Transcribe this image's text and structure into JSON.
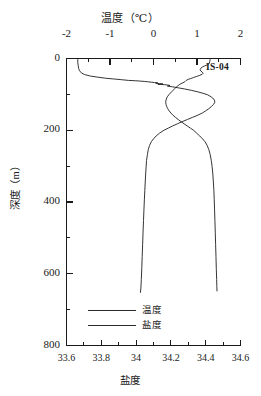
{
  "station": {
    "label": "IS-04"
  },
  "axes": {
    "top": {
      "title": "温度（℃）",
      "ticks": [
        "-2",
        "-1",
        "0",
        "1",
        "2"
      ]
    },
    "bottom": {
      "title": "盐度",
      "ticks": [
        "33.6",
        "33.8",
        "34",
        "34.2",
        "34.4",
        "34.6"
      ]
    },
    "left": {
      "title": "深度（m）",
      "ticks": [
        "0",
        "200",
        "400",
        "600",
        "800"
      ]
    }
  },
  "legend": {
    "items": [
      {
        "name": "温度"
      },
      {
        "name": "盐度"
      }
    ]
  },
  "chart_data": {
    "type": "line",
    "title": "温度（℃）",
    "subtitle": "IS-04",
    "xlabel_top": "温度（℃）",
    "xlabel_bottom": "盐度",
    "ylabel": "深度（m）",
    "grid": false,
    "legend_position": "inside-lower-left",
    "y_axis": {
      "label": "深度（m）",
      "min": 0,
      "max": 800,
      "inverted": true,
      "major_step": 200,
      "minor_step": 100,
      "ticks": [
        0,
        200,
        400,
        600,
        800
      ]
    },
    "x_axis_top": {
      "label": "温度（℃）",
      "min": -2,
      "max": 2,
      "major_step": 1,
      "minor_step": 0.5,
      "ticks": [
        -2,
        -1,
        0,
        1,
        2
      ],
      "units": "℃"
    },
    "x_axis_bottom": {
      "label": "盐度",
      "min": 33.6,
      "max": 34.6,
      "major_step": 0.2,
      "minor_step": 0.1,
      "ticks": [
        33.6,
        33.8,
        34.0,
        34.2,
        34.4,
        34.6
      ]
    },
    "series": [
      {
        "name": "温度",
        "axis": "top",
        "units": "℃",
        "points": [
          [
            -1.74,
            3
          ],
          [
            -1.74,
            12
          ],
          [
            -1.73,
            20
          ],
          [
            -1.72,
            28
          ],
          [
            -1.7,
            34
          ],
          [
            -1.66,
            40
          ],
          [
            -1.58,
            45
          ],
          [
            -1.45,
            49
          ],
          [
            -1.28,
            52
          ],
          [
            -1.1,
            55
          ],
          [
            -0.92,
            57
          ],
          [
            -0.74,
            59
          ],
          [
            -0.58,
            61
          ],
          [
            -0.42,
            62
          ],
          [
            -0.3,
            63
          ],
          [
            -0.2,
            64
          ],
          [
            -0.12,
            65
          ],
          [
            -0.05,
            66
          ],
          [
            0.02,
            67
          ],
          [
            0.1,
            68
          ],
          [
            0.05,
            69
          ],
          [
            0.14,
            70
          ],
          [
            0.22,
            71
          ],
          [
            0.1,
            72
          ],
          [
            0.26,
            73
          ],
          [
            0.38,
            75
          ],
          [
            0.32,
            77
          ],
          [
            0.44,
            79
          ],
          [
            0.58,
            82
          ],
          [
            0.72,
            85
          ],
          [
            0.88,
            89
          ],
          [
            1.02,
            93
          ],
          [
            1.14,
            97
          ],
          [
            1.24,
            101
          ],
          [
            1.3,
            105
          ],
          [
            1.36,
            110
          ],
          [
            1.4,
            116
          ],
          [
            1.41,
            122
          ],
          [
            1.38,
            128
          ],
          [
            1.33,
            134
          ],
          [
            1.27,
            140
          ],
          [
            1.2,
            146
          ],
          [
            1.12,
            152
          ],
          [
            1.02,
            158
          ],
          [
            0.9,
            164
          ],
          [
            0.78,
            170
          ],
          [
            0.66,
            176
          ],
          [
            0.55,
            182
          ],
          [
            0.44,
            188
          ],
          [
            0.34,
            194
          ],
          [
            0.24,
            200
          ],
          [
            0.14,
            208
          ],
          [
            0.06,
            216
          ],
          [
            0.0,
            224
          ],
          [
            -0.05,
            232
          ],
          [
            -0.09,
            242
          ],
          [
            -0.12,
            254
          ],
          [
            -0.14,
            268
          ],
          [
            -0.16,
            284
          ],
          [
            -0.17,
            302
          ],
          [
            -0.18,
            322
          ],
          [
            -0.19,
            344
          ],
          [
            -0.2,
            368
          ],
          [
            -0.21,
            394
          ],
          [
            -0.22,
            422
          ],
          [
            -0.23,
            452
          ],
          [
            -0.24,
            484
          ],
          [
            -0.25,
            518
          ],
          [
            -0.26,
            552
          ],
          [
            -0.27,
            586
          ],
          [
            -0.28,
            616
          ],
          [
            -0.29,
            640
          ],
          [
            -0.3,
            652
          ]
        ]
      },
      {
        "name": "盐度",
        "axis": "bottom",
        "units": "",
        "points": [
          [
            34.425,
            3
          ],
          [
            34.423,
            9
          ],
          [
            34.42,
            14
          ],
          [
            34.408,
            18
          ],
          [
            34.392,
            21
          ],
          [
            34.38,
            24
          ],
          [
            34.372,
            27
          ],
          [
            34.368,
            31
          ],
          [
            34.372,
            35
          ],
          [
            34.38,
            38
          ],
          [
            34.386,
            41
          ],
          [
            34.38,
            44
          ],
          [
            34.366,
            47
          ],
          [
            34.348,
            50
          ],
          [
            34.33,
            53
          ],
          [
            34.314,
            56
          ],
          [
            34.3,
            58
          ],
          [
            34.292,
            60
          ],
          [
            34.286,
            62
          ],
          [
            34.282,
            64
          ],
          [
            34.276,
            66
          ],
          [
            34.268,
            68
          ],
          [
            34.258,
            70
          ],
          [
            34.252,
            72
          ],
          [
            34.246,
            74
          ],
          [
            34.238,
            77
          ],
          [
            34.23,
            80
          ],
          [
            34.222,
            84
          ],
          [
            34.214,
            88
          ],
          [
            34.206,
            92
          ],
          [
            34.198,
            96
          ],
          [
            34.19,
            100
          ],
          [
            34.182,
            105
          ],
          [
            34.176,
            110
          ],
          [
            34.172,
            116
          ],
          [
            34.17,
            122
          ],
          [
            34.172,
            128
          ],
          [
            34.176,
            134
          ],
          [
            34.182,
            140
          ],
          [
            34.19,
            146
          ],
          [
            34.2,
            152
          ],
          [
            34.212,
            158
          ],
          [
            34.226,
            164
          ],
          [
            34.242,
            170
          ],
          [
            34.258,
            176
          ],
          [
            34.276,
            182
          ],
          [
            34.294,
            188
          ],
          [
            34.312,
            194
          ],
          [
            34.33,
            200
          ],
          [
            34.348,
            208
          ],
          [
            34.366,
            216
          ],
          [
            34.382,
            224
          ],
          [
            34.396,
            232
          ],
          [
            34.408,
            242
          ],
          [
            34.418,
            254
          ],
          [
            34.426,
            268
          ],
          [
            34.432,
            284
          ],
          [
            34.437,
            302
          ],
          [
            34.441,
            322
          ],
          [
            34.444,
            344
          ],
          [
            34.447,
            368
          ],
          [
            34.449,
            394
          ],
          [
            34.451,
            422
          ],
          [
            34.453,
            452
          ],
          [
            34.455,
            484
          ],
          [
            34.457,
            518
          ],
          [
            34.459,
            552
          ],
          [
            34.461,
            586
          ],
          [
            34.463,
            616
          ],
          [
            34.464,
            636
          ],
          [
            34.465,
            648
          ]
        ]
      }
    ]
  }
}
